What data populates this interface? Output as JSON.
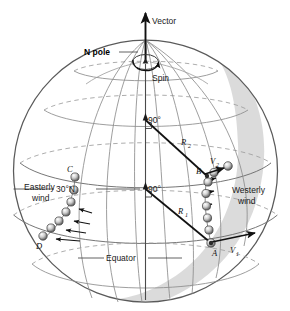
{
  "figure": {
    "width": 290,
    "height": 311,
    "background_color": "#ffffff"
  },
  "colors": {
    "outline": "#4a4a4a",
    "grid_line": "#8a8a8a",
    "grid_dashed": "#9a9a9a",
    "shadow_fill": "#d9d9d9",
    "radius_line": "#1a1a1a",
    "sphere_dark": "#5a5a5a",
    "sphere_light": "#ffffff",
    "text": "#1a1a1a"
  },
  "globe": {
    "center_x": 145.5,
    "center_y": 171,
    "radius_x": 132,
    "radius_y": 131,
    "shading_label": "terminator-shadow"
  },
  "labels": {
    "vector": "Vector",
    "n_pole": "N pole",
    "spin": "Spin",
    "angle_upper": "90°",
    "angle_lower": "90°",
    "latitude_30n": "30°N",
    "equator": "Equator",
    "easterly_wind_line1": "Easterly",
    "easterly_wind_line2": "wind",
    "westerly_wind_line1": "Westerly",
    "westerly_wind_line2": "wind",
    "radius_r1": "R",
    "radius_r1_sub": "1",
    "radius_r2": "R",
    "radius_r2_sub": "2",
    "velocity_v1": "V",
    "velocity_v1_sub": "1",
    "velocity_v2": "V",
    "velocity_v2_sub": "2",
    "point_a": "A",
    "point_b": "B",
    "point_c": "C",
    "point_d": "D"
  },
  "points": {
    "a": {
      "label": "A",
      "x": 211,
      "y": 243,
      "description": "equator-start-point"
    },
    "b": {
      "label": "B",
      "x": 207,
      "y": 176,
      "description": "thirty-north-endpoint"
    },
    "c": {
      "label": "C",
      "x": 75,
      "y": 177,
      "description": "thirty-north-start-point"
    },
    "d": {
      "label": "D",
      "x": 43,
      "y": 238,
      "description": "equator-endpoint"
    }
  },
  "vectors": {
    "spin_axis": {
      "from_y": 300,
      "to_y": 10,
      "x": 145.5,
      "label": "Vector"
    },
    "v1": {
      "label": "V1",
      "at_point": "A",
      "direction": "eastward-equator"
    },
    "v2": {
      "label": "V2",
      "at_point": "B",
      "direction": "eastward-30N"
    }
  },
  "radii": [
    {
      "name": "R1",
      "label": "R",
      "sub": "1",
      "from_axis_y": 189,
      "to_point": "A",
      "angle": "90°"
    },
    {
      "name": "R2",
      "label": "R",
      "sub": "2",
      "from_axis_y": 120,
      "to_point": "B",
      "angle": "90°"
    }
  ],
  "parcel_chains": [
    {
      "name": "westerly-chain",
      "from": "A",
      "to": "B",
      "count": 8,
      "side": "right"
    },
    {
      "name": "easterly-chain",
      "from": "C",
      "to": "D",
      "count": 7,
      "side": "left"
    }
  ],
  "grid": {
    "latitudes": [
      "north-polar-circle",
      "60N",
      "30N",
      "equator",
      "30S"
    ],
    "meridians_count": 7,
    "dashed_back_side": true
  }
}
